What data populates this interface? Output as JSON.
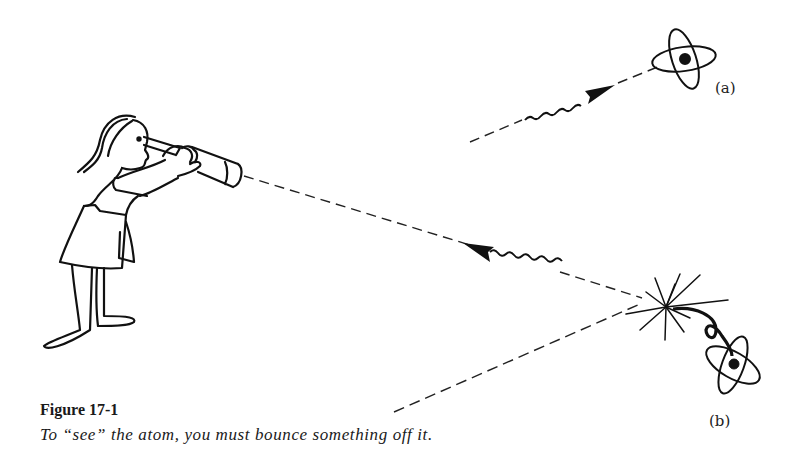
{
  "figure": {
    "number_label": "Figure 17-1",
    "caption": "To “see” the atom, you must bounce something off it.",
    "panel_labels": {
      "a": "(a)",
      "b": "(b)"
    },
    "elements": [
      "girl-with-telescope",
      "incident-photon-a",
      "atom-a",
      "incident-photon-b",
      "scattered-photon-b",
      "collision-burst",
      "recoiling-atom-b"
    ],
    "colors": {
      "ink": "#111111",
      "paper": "#ffffff"
    }
  }
}
